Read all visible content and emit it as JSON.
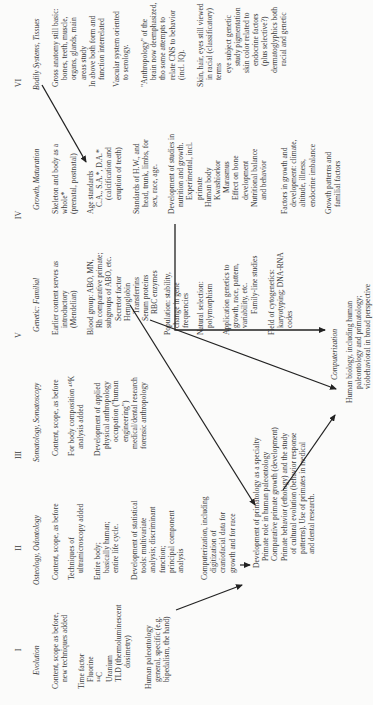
{
  "columns": [
    {
      "numeral": "I",
      "title": "Evolution",
      "blocks": [
        [
          "Content, scope as before,",
          "new techniques added"
        ],
        [
          "Time factor",
          "Fluorine",
          "¹⁴C",
          "Uranium",
          "TLD (thermoluminescent",
          "dosimetry)"
        ],
        [
          "Human paleontology",
          "general, specific (e.g.",
          "bipedalism, the hand)"
        ]
      ]
    },
    {
      "numeral": "II",
      "title": "Osteology, Odontology",
      "blocks": [
        [
          "Content, scope, as before"
        ],
        [
          "Techniques of",
          "ultramicroscopy added"
        ],
        [
          "Entire body;",
          "basically human;",
          "entire life cycle."
        ],
        [
          "Development of statistical",
          "tools: multivariate",
          "analysis; discriminant",
          "function;",
          "principal component",
          "analysis"
        ],
        [
          "Computerization, including",
          "digitization of",
          "craniofacial data for",
          "growth and for race"
        ]
      ]
    },
    {
      "numeral": "III",
      "title": "Somatology, Somatoscopy",
      "blocks": [
        [
          "Content, scope, as before"
        ],
        [
          "For body composition ⁴⁰K",
          "analysis added"
        ],
        [
          "Development of applied",
          "physical anthropology",
          "occupation (\"human",
          "engineering\")",
          "medical/dental research",
          "forensic anthropology"
        ]
      ]
    },
    {
      "numeral": "V",
      "title": "Genetic: Familial",
      "blocks": [
        [
          "Earlier content serves as",
          "introductory",
          "(Mendelian)"
        ],
        [
          "Blood group: ABO, MN,",
          "Rh comparative primate;",
          "subgroups of ABO, etc.",
          "Secretor factor",
          "Hemoglobin",
          "Transferrins",
          "Serum proteins",
          "RBC enzymes"
        ],
        [
          "Population: stability,",
          "change in gene",
          "frequencies"
        ],
        [
          "Natural selection:",
          "polymorphism"
        ],
        [
          "Application genetics to",
          "growth, race, pattern,",
          "variability, etc.",
          "Family-line studies"
        ],
        [
          "Field of cytogenetics:",
          "karyotyping; DNA-RNA",
          "codes"
        ]
      ]
    },
    {
      "numeral": "IV",
      "title": "Growth, Maturation",
      "blocks": [
        [
          "Skeleton and body as a",
          "whole*",
          "(prenatal, postnatal)"
        ],
        [
          "Age standards",
          "C.A., S.A.*, D.A.*",
          "(calcification and",
          "eruption of teeth)"
        ],
        [
          "Standards of H.W., and",
          "head, trunk, limbs, for",
          "sex, race, age."
        ],
        [
          "Development of studies in",
          "nutrition and growth.",
          "Experimental, incl.",
          "primate",
          "Human body",
          "Kwashiorkor",
          "Marasmus",
          "Effect on bone",
          "development",
          "Nutritional balance",
          "and behavior"
        ],
        [
          "Factors in growth and",
          "development: climate,",
          "altitude, illness,",
          "endocrine imbalance"
        ],
        [
          "Growth patterns and",
          "familial factors"
        ]
      ]
    },
    {
      "numeral": "VI",
      "title": "Bodily Systems, Tissues",
      "blocks": [
        [
          "Gross anatomy still basic:",
          "bones, teeth, muscle,",
          "organs, glands, main",
          "areas study",
          "In above both form and",
          "function interrelated"
        ],
        [
          "Vascular system oriented",
          "to serology."
        ],
        [
          "\"Anthropology\" of the",
          "brain now deemphasized,",
          "tho some attempts to",
          "relate CNS to behavior",
          "(incl. IQ)."
        ],
        [
          "Skin, hair, eyes still viewed",
          "in racial (classificatory)",
          "terms",
          "eye subject genetic",
          "study pigmentation",
          "skin color related to",
          "endocrine factors",
          "(plus selective?)",
          "dermatoglyphics both",
          "racial and genetic"
        ]
      ]
    }
  ],
  "primatology": {
    "lines": [
      "Development of primatology as a specialty",
      "Primate role in human paleontology",
      "Comparative primate growth (development)",
      "Primate behavior (ethology) and the study",
      "of cultural evolution (behavior response",
      "patterns). Use of primates in medical",
      "and dental research."
    ]
  },
  "computerization": {
    "title": "Computerization",
    "lines": [
      "Human biology, including human",
      "paleontology and primatology;",
      "viobehavioral in broad perspective"
    ]
  }
}
